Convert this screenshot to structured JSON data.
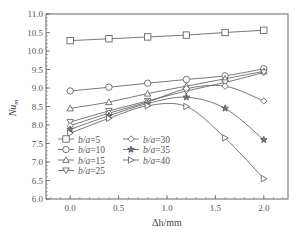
{
  "chart_data": {
    "type": "line",
    "title": "",
    "xlabel": "Δh/mm",
    "ylabel": "Nu_m",
    "x": [
      0.0,
      0.4,
      0.8,
      1.2,
      1.6,
      2.0
    ],
    "xlim": [
      -0.25,
      2.25
    ],
    "ylim": [
      6.0,
      11.0
    ],
    "xticks": [
      "0.0",
      "0.5",
      "1.0",
      "1.5",
      "2.0"
    ],
    "yticks": [
      "6.0",
      "6.5",
      "7.0",
      "7.5",
      "8.0",
      "8.5",
      "9.0",
      "9.5",
      "10.0",
      "10.5",
      "11.0"
    ],
    "grid": false,
    "legend_position": "lower-left inside",
    "series": [
      {
        "name": "b/a=5",
        "marker": "square",
        "values": [
          10.28,
          10.33,
          10.38,
          10.43,
          10.5,
          10.56
        ]
      },
      {
        "name": "b/a=10",
        "marker": "circle",
        "values": [
          8.92,
          9.02,
          9.13,
          9.23,
          9.33,
          9.52
        ]
      },
      {
        "name": "b/a=15",
        "marker": "triangle-up",
        "values": [
          8.45,
          8.62,
          8.85,
          9.05,
          9.25,
          9.45
        ]
      },
      {
        "name": "b/a=25",
        "marker": "triangle-down",
        "values": [
          8.08,
          8.38,
          8.65,
          8.92,
          9.15,
          9.42
        ]
      },
      {
        "name": "b/a=30",
        "marker": "diamond",
        "values": [
          7.98,
          8.32,
          8.62,
          8.98,
          9.05,
          8.65
        ]
      },
      {
        "name": "b/a=35",
        "marker": "star",
        "values": [
          7.88,
          8.25,
          8.58,
          8.75,
          8.45,
          7.6
        ]
      },
      {
        "name": "b/a=40",
        "marker": "triangle-right",
        "values": [
          7.78,
          8.18,
          8.52,
          8.5,
          7.65,
          6.55
        ]
      }
    ]
  },
  "labels": {
    "ylabel_main": "Nu",
    "ylabel_sub": "m",
    "xlabel": "Δh/mm"
  }
}
